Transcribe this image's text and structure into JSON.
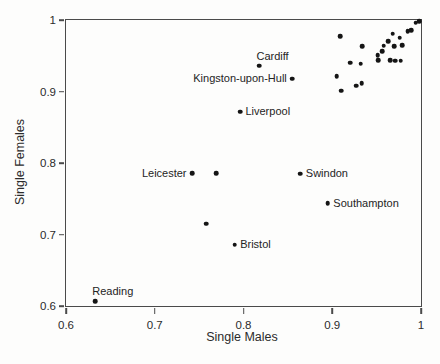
{
  "figure": {
    "background": "#fdfdfc",
    "axis_color": "#4a4a4a",
    "text_color": "#2b2b2b",
    "point_color": "#151515"
  },
  "chart_data": {
    "type": "scatter",
    "title": "",
    "xlabel": "Single Males",
    "ylabel": "Single Females",
    "xlim": [
      0.6,
      1.0
    ],
    "ylim": [
      0.6,
      1.0
    ],
    "grid": false,
    "legend": null,
    "xtick_values": [
      0.6,
      0.7,
      0.8,
      0.9,
      1.0
    ],
    "xtick_labels": [
      "0.6",
      "0.7",
      "0.8",
      "0.9",
      "1"
    ],
    "ytick_values": [
      0.6,
      0.7,
      0.8,
      0.9,
      1.0
    ],
    "ytick_labels": [
      "0.6",
      "0.7",
      "0.8",
      "0.9",
      "1"
    ],
    "labeled_points": [
      {
        "name": "Reading",
        "x": 0.633,
        "y": 0.607,
        "label_side": "above"
      },
      {
        "name": "Bristol",
        "x": 0.79,
        "y": 0.686,
        "label_side": "right"
      },
      {
        "name": "Leicester",
        "x": 0.742,
        "y": 0.786,
        "label_side": "left"
      },
      {
        "name": "Swindon",
        "x": 0.864,
        "y": 0.785,
        "label_side": "right"
      },
      {
        "name": "Southampton",
        "x": 0.895,
        "y": 0.744,
        "label_side": "right"
      },
      {
        "name": "Liverpool",
        "x": 0.796,
        "y": 0.872,
        "label_side": "right"
      },
      {
        "name": "Kingston-upon-Hull",
        "x": 0.855,
        "y": 0.918,
        "label_side": "left"
      },
      {
        "name": "Cardiff",
        "x": 0.818,
        "y": 0.936,
        "label_side": "above"
      }
    ],
    "unlabeled_points": [
      [
        0.758,
        0.715
      ],
      [
        0.769,
        0.786
      ],
      [
        0.909,
        0.977
      ],
      [
        0.934,
        0.963
      ],
      [
        0.92,
        0.94
      ],
      [
        0.932,
        0.939
      ],
      [
        0.905,
        0.921
      ],
      [
        0.91,
        0.901
      ],
      [
        0.927,
        0.908
      ],
      [
        0.933,
        0.912
      ],
      [
        0.951,
        0.951
      ],
      [
        0.952,
        0.944
      ],
      [
        0.956,
        0.956
      ],
      [
        0.958,
        0.964
      ],
      [
        0.963,
        0.97
      ],
      [
        0.965,
        0.944
      ],
      [
        0.971,
        0.943
      ],
      [
        0.977,
        0.943
      ],
      [
        0.97,
        0.963
      ],
      [
        0.968,
        0.981
      ],
      [
        0.976,
        0.975
      ],
      [
        0.979,
        0.965
      ],
      [
        0.985,
        0.984
      ],
      [
        0.989,
        0.986
      ],
      [
        0.994,
        0.996
      ],
      [
        0.998,
        0.998
      ]
    ]
  }
}
